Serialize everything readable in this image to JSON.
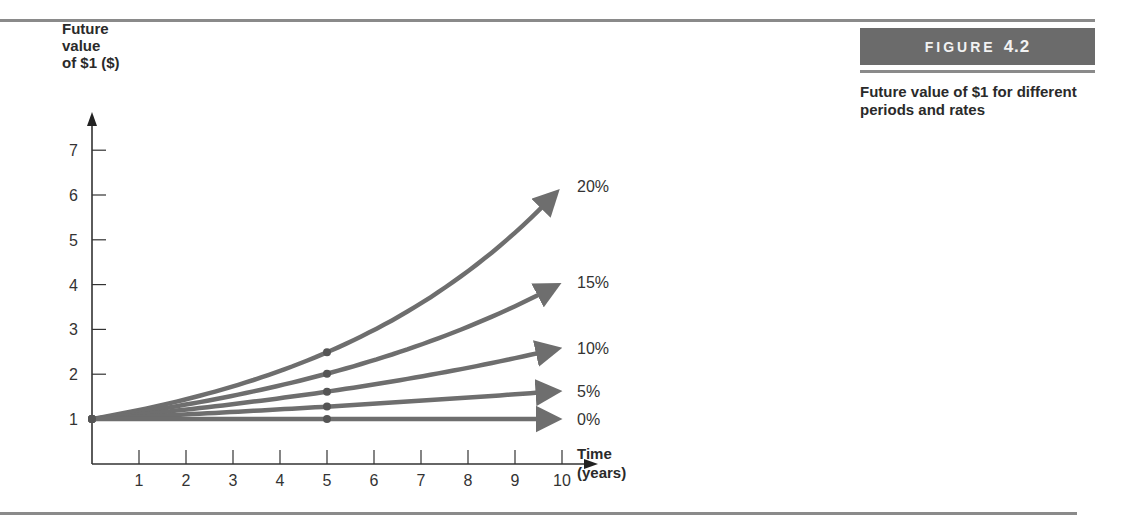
{
  "figure": {
    "label_word": "FIGURE",
    "label_number": "4.2",
    "caption": "Future value of $1 for different periods and rates"
  },
  "colors": {
    "line": "#6e6e6e",
    "axis": "#333333",
    "figure_box": "#6b6b6b",
    "rule": "#8a8a8a"
  },
  "chart_data": {
    "type": "line",
    "title": "Future value of $1 for different periods and rates",
    "xlabel": "Time (years)",
    "ylabel": "Future value of $1 ($)",
    "x": [
      0,
      1,
      2,
      3,
      4,
      5,
      6,
      7,
      8,
      9,
      10
    ],
    "xticks": [
      "1",
      "2",
      "3",
      "4",
      "5",
      "6",
      "7",
      "8",
      "9",
      "10"
    ],
    "yticks": [
      "1",
      "2",
      "3",
      "4",
      "5",
      "6",
      "7"
    ],
    "xlim": [
      0,
      10
    ],
    "ylim": [
      0,
      7
    ],
    "grid": false,
    "legend_position": "inline-right",
    "markers_at_x": [
      0,
      5
    ],
    "series": [
      {
        "name": "20%",
        "values": [
          1.0,
          1.2,
          1.44,
          1.73,
          2.07,
          2.49,
          2.99,
          3.58,
          4.3,
          5.16,
          6.19
        ]
      },
      {
        "name": "15%",
        "values": [
          1.0,
          1.15,
          1.32,
          1.52,
          1.75,
          2.01,
          2.31,
          2.66,
          3.06,
          3.52,
          4.05
        ]
      },
      {
        "name": "10%",
        "values": [
          1.0,
          1.1,
          1.21,
          1.33,
          1.46,
          1.61,
          1.77,
          1.95,
          2.14,
          2.36,
          2.59
        ]
      },
      {
        "name": "5%",
        "values": [
          1.0,
          1.05,
          1.1,
          1.16,
          1.22,
          1.28,
          1.34,
          1.41,
          1.48,
          1.55,
          1.63
        ]
      },
      {
        "name": "0%",
        "values": [
          1.0,
          1.0,
          1.0,
          1.0,
          1.0,
          1.0,
          1.0,
          1.0,
          1.0,
          1.0,
          1.0
        ]
      }
    ]
  },
  "axis": {
    "y_title": "Future\nvalue\nof $1 ($)",
    "x_title_line1": "Time",
    "x_title_line2": "(years)"
  }
}
